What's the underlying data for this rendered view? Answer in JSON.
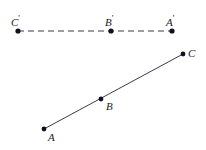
{
  "figure": {
    "background_color": "#ffffff",
    "stroke_color": "#3c3c50",
    "point_color": "#101020",
    "label_color": "#1a1a28",
    "width": 206,
    "height": 150
  },
  "image_line": {
    "name": "dashed-image-line",
    "style": "dashed",
    "dash_pattern": "6 4",
    "x1": 18,
    "y1": 31,
    "x2": 172,
    "y2": 31,
    "points": [
      {
        "label": "C",
        "prime": "'",
        "x": 18,
        "y": 31,
        "label_x": 11,
        "label_y": 14
      },
      {
        "label": "B",
        "prime": "'",
        "x": 111,
        "y": 31,
        "label_x": 104,
        "label_y": 14
      },
      {
        "label": "A",
        "prime": "'",
        "x": 172,
        "y": 31,
        "label_x": 165,
        "label_y": 14
      }
    ]
  },
  "object_line": {
    "name": "solid-object-line",
    "style": "solid",
    "x1": 44,
    "y1": 129,
    "x2": 183,
    "y2": 54,
    "points": [
      {
        "label": "A",
        "prime": "",
        "x": 44,
        "y": 129,
        "label_x": 48,
        "label_y": 133
      },
      {
        "label": "B",
        "prime": "",
        "x": 101,
        "y": 99,
        "label_x": 106,
        "label_y": 102
      },
      {
        "label": "C",
        "prime": "",
        "x": 183,
        "y": 54,
        "label_x": 188,
        "label_y": 48
      }
    ]
  },
  "labels": {
    "c_prime": "C",
    "b_prime": "B",
    "a_prime": "A",
    "a": "A",
    "b": "B",
    "c": "C",
    "prime_mark": "'"
  }
}
